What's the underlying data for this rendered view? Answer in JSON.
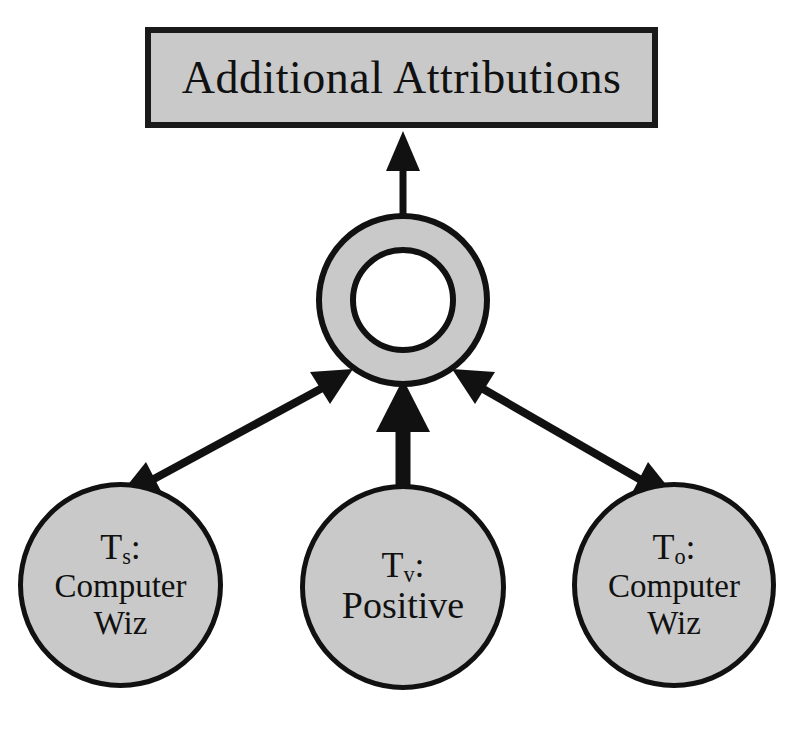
{
  "diagram": {
    "background_color": "#ffffff",
    "node_fill_color": "#c9c9c9",
    "node_stroke_color": "#111111",
    "title_box": {
      "label": "Additional Attributions"
    },
    "hub": {
      "shape_name": "annulus"
    },
    "nodes": [
      {
        "id": "source",
        "head_symbol": "T",
        "head_subscript": "s",
        "head_suffix": ":",
        "lines": [
          "Computer",
          "Wiz"
        ]
      },
      {
        "id": "value",
        "head_symbol": "T",
        "head_subscript": "v",
        "head_suffix": ":",
        "lines": [
          "Positive"
        ]
      },
      {
        "id": "object",
        "head_symbol": "T",
        "head_subscript": "o",
        "head_suffix": ":",
        "lines": [
          "Computer",
          "Wiz"
        ]
      }
    ],
    "edges": [
      {
        "id": "hub-to-title",
        "from": "hub",
        "to": "title_box",
        "style": "thin-arrow",
        "heads": "single"
      },
      {
        "id": "value-to-hub",
        "from": "value",
        "to": "hub",
        "style": "thick-arrow",
        "heads": "single"
      },
      {
        "id": "source-hub",
        "from": "source",
        "to": "hub",
        "style": "double-headed-arrow",
        "heads": "double"
      },
      {
        "id": "object-hub",
        "from": "object",
        "to": "hub",
        "style": "double-headed-arrow",
        "heads": "double"
      }
    ]
  }
}
